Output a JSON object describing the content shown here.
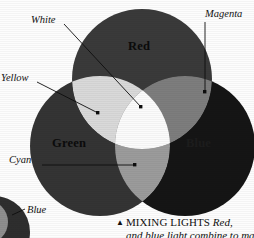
{
  "figure": {
    "type": "venn-additive-color",
    "background_color": "#fdfdfd",
    "rendering": "grayscale halftone print scan"
  },
  "circles": [
    {
      "id": "red",
      "label": "Red",
      "color": "#3a3a3a",
      "cx": 142,
      "cy": 79,
      "r": 70
    },
    {
      "id": "green",
      "label": "Green",
      "color": "#343434",
      "cx": 100,
      "cy": 146,
      "r": 70
    },
    {
      "id": "blue",
      "label": "Blue",
      "color": "#151515",
      "cx": 185,
      "cy": 146,
      "r": 70
    }
  ],
  "overlaps": [
    {
      "id": "yellow",
      "label": "Yellow",
      "parents": "red+green",
      "color": "#d9d9d9"
    },
    {
      "id": "magenta",
      "label": "Magenta",
      "parents": "red+blue",
      "color": "#7d7d7d"
    },
    {
      "id": "cyan",
      "label": "Cyan",
      "parents": "green+blue",
      "color": "#9b9b9b"
    },
    {
      "id": "white",
      "label": "White",
      "parents": "red+green+blue",
      "color": "#fbfbfb"
    }
  ],
  "callouts": [
    {
      "id": "white",
      "label": "White",
      "dot_x": 141,
      "dot_y": 107
    },
    {
      "id": "yellow",
      "label": "Yellow",
      "dot_x": 98,
      "dot_y": 113
    },
    {
      "id": "magenta",
      "label": "Magenta",
      "dot_x": 205,
      "dot_y": 92
    },
    {
      "id": "cyan",
      "label": "Cyan",
      "dot_x": 135,
      "dot_y": 165
    }
  ],
  "inset_figure": {
    "callout_label": "Blue",
    "dot_x": 17,
    "dot_y": 212
  },
  "caption": {
    "marker": "▲",
    "headword": "MIXING LIGHTS",
    "italic_tail": "Red,",
    "line2": "and blue light combine to make"
  }
}
